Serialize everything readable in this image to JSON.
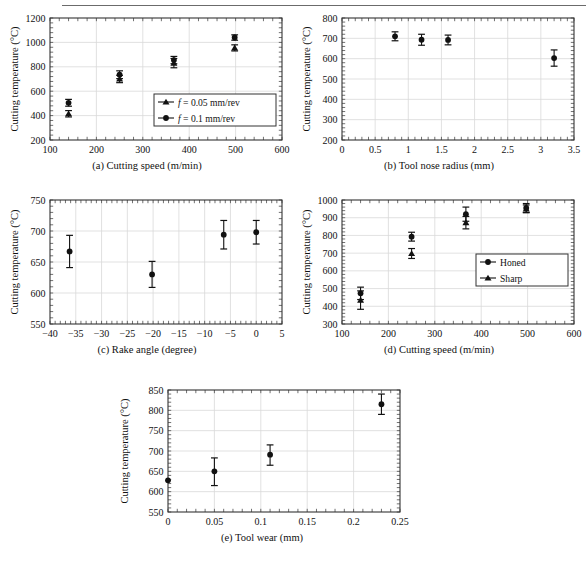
{
  "figure": {
    "has_top_rule": true,
    "background": "#ffffff",
    "marker_color": "#111111",
    "grid_color": "#d9d9d9",
    "axis_color": "#333333"
  },
  "panels": [
    {
      "id": "a",
      "caption": "(a) Cutting speed (m/min)",
      "ylabel": "Cutting temperature (°C)",
      "xticks": [
        "100",
        "200",
        "300",
        "400",
        "500",
        "600"
      ],
      "yticks": [
        "200",
        "400",
        "600",
        "800",
        "1000",
        "1200"
      ],
      "legend": [
        {
          "marker": "triangle",
          "label": "f = 0.05 mm/rev",
          "italic_lead": "f"
        },
        {
          "marker": "circle",
          "label": "f = 0.1 mm/rev",
          "italic_lead": "f"
        }
      ],
      "chart_data": {
        "type": "scatter",
        "title": "(a) Cutting speed (m/min)",
        "xlabel": "Cutting speed (m/min)",
        "ylabel": "Cutting temperature (°C)",
        "xlim": [
          100,
          600
        ],
        "ylim": [
          200,
          1200
        ],
        "xticks": [
          100,
          200,
          300,
          400,
          500,
          600
        ],
        "yticks": [
          200,
          400,
          600,
          800,
          1000,
          1200
        ],
        "grid": true,
        "legend_position": "lower right",
        "series": [
          {
            "name": "f = 0.1 mm/rev",
            "marker": "circle",
            "x": [
              140,
              250,
              367,
              498
            ],
            "y": [
              505,
              735,
              855,
              1040
            ],
            "yerr_low": [
              28,
              32,
              30,
              22
            ],
            "yerr_high": [
              28,
              32,
              30,
              22
            ]
          },
          {
            "name": "f = 0.05 mm/rev",
            "marker": "triangle",
            "x": [
              140,
              250,
              367,
              498
            ],
            "y": [
              415,
              700,
              830,
              955
            ],
            "yerr_low": [
              26,
              30,
              38,
              25
            ],
            "yerr_high": [
              26,
              30,
              38,
              25
            ]
          }
        ]
      }
    },
    {
      "id": "b",
      "caption": "(b) Tool nose radius (mm)",
      "ylabel": "Cutting temperature (°C)",
      "xticks": [
        "0",
        "0.5",
        "1",
        "1.5",
        "2",
        "2.5",
        "3",
        "3.5"
      ],
      "yticks": [
        "200",
        "300",
        "400",
        "500",
        "600",
        "700",
        "800"
      ],
      "legend": [],
      "chart_data": {
        "type": "scatter",
        "title": "(b) Tool nose radius (mm)",
        "xlabel": "Tool nose radius (mm)",
        "ylabel": "Cutting temperature (°C)",
        "xlim": [
          0,
          3.5
        ],
        "ylim": [
          200,
          800
        ],
        "xticks": [
          0,
          0.5,
          1,
          1.5,
          2,
          2.5,
          3,
          3.5
        ],
        "yticks": [
          200,
          300,
          400,
          500,
          600,
          700,
          800
        ],
        "grid": true,
        "series": [
          {
            "name": "Honed",
            "marker": "circle",
            "x": [
              0.8,
              1.2,
              1.6,
              3.2
            ],
            "y": [
              710,
              693,
              692,
              603
            ],
            "yerr_low": [
              22,
              27,
              24,
              40
            ],
            "yerr_high": [
              22,
              27,
              24,
              40
            ]
          }
        ]
      }
    },
    {
      "id": "c",
      "caption": "(c) Rake angle (degree)",
      "ylabel": "Cutting temperature (°C)",
      "xticks": [
        "−40",
        "−35",
        "−30",
        "−25",
        "−20",
        "−15",
        "−10",
        "−5",
        "0",
        "5"
      ],
      "yticks": [
        "550",
        "600",
        "650",
        "700",
        "750"
      ],
      "legend": [],
      "chart_data": {
        "type": "scatter",
        "title": "(c) Rake angle (degree)",
        "xlabel": "Rake angle (degree)",
        "ylabel": "Cutting temperature (°C)",
        "xlim": [
          -40,
          5
        ],
        "ylim": [
          550,
          750
        ],
        "xticks": [
          -40,
          -35,
          -30,
          -25,
          -20,
          -15,
          -10,
          -5,
          0,
          5
        ],
        "yticks": [
          550,
          600,
          650,
          700,
          750
        ],
        "grid": true,
        "series": [
          {
            "name": "Honed",
            "marker": "circle",
            "x": [
              -36.2,
              -20.2,
              -6.3,
              0
            ],
            "y": [
              667,
              630,
              694,
              698
            ],
            "yerr_low": [
              26,
              21,
              23,
              19
            ],
            "yerr_high": [
              26,
              21,
              23,
              19
            ]
          }
        ]
      }
    },
    {
      "id": "d",
      "caption": "(d) Cutting speed (m/min)",
      "ylabel": "Cutting temperature (°C)",
      "xticks": [
        "100",
        "200",
        "300",
        "400",
        "500",
        "600"
      ],
      "yticks": [
        "300",
        "400",
        "500",
        "600",
        "700",
        "800",
        "900",
        "1000"
      ],
      "legend": [
        {
          "marker": "circle",
          "label": "Honed",
          "italic_lead": ""
        },
        {
          "marker": "triangle",
          "label": "Sharp",
          "italic_lead": ""
        }
      ],
      "chart_data": {
        "type": "scatter",
        "title": "(d) Cutting speed (m/min)",
        "xlabel": "Cutting speed (m/min)",
        "ylabel": "Cutting temperature (°C)",
        "xlim": [
          100,
          600
        ],
        "ylim": [
          300,
          1000
        ],
        "xticks": [
          100,
          200,
          300,
          400,
          500,
          600
        ],
        "yticks": [
          300,
          400,
          500,
          600,
          700,
          800,
          900,
          1000
        ],
        "grid": true,
        "legend_position": "center right",
        "series": [
          {
            "name": "Honed",
            "marker": "circle",
            "x": [
              140,
              250,
              367,
              497
            ],
            "y": [
              473,
              793,
              920,
              955
            ],
            "yerr_low": [
              35,
              25,
              40,
              25
            ],
            "yerr_high": [
              35,
              25,
              40,
              25
            ]
          },
          {
            "name": "Sharp",
            "marker": "triangle",
            "x": [
              140,
              250,
              367,
              497
            ],
            "y": [
              435,
              698,
              872,
              950
            ],
            "yerr_low": [
              52,
              28,
              35,
              22
            ],
            "yerr_high": [
              52,
              28,
              35,
              22
            ]
          }
        ]
      }
    },
    {
      "id": "e",
      "caption": "(e) Tool wear (mm)",
      "ylabel": "Cutting temperature (°C)",
      "xticks": [
        "0",
        "0.05",
        "0.1",
        "0.15",
        "0.2",
        "0.25"
      ],
      "yticks": [
        "550",
        "600",
        "650",
        "700",
        "750",
        "800",
        "850"
      ],
      "legend": [],
      "chart_data": {
        "type": "scatter",
        "title": "(e) Tool wear (mm)",
        "xlabel": "Tool wear (mm)",
        "ylabel": "Cutting temperature (°C)",
        "xlim": [
          0,
          0.25
        ],
        "ylim": [
          550,
          850
        ],
        "xticks": [
          0,
          0.05,
          0.1,
          0.15,
          0.2,
          0.25
        ],
        "yticks": [
          550,
          600,
          650,
          700,
          750,
          800,
          850
        ],
        "grid": true,
        "series": [
          {
            "name": "Honed",
            "marker": "circle",
            "x": [
              0,
              0.05,
              0.11,
              0.23
            ],
            "y": [
              628,
              650,
              691,
              815
            ],
            "yerr_low": [
              0,
              35,
              26,
              25
            ],
            "yerr_high": [
              0,
              33,
              24,
              25
            ]
          }
        ]
      }
    }
  ]
}
